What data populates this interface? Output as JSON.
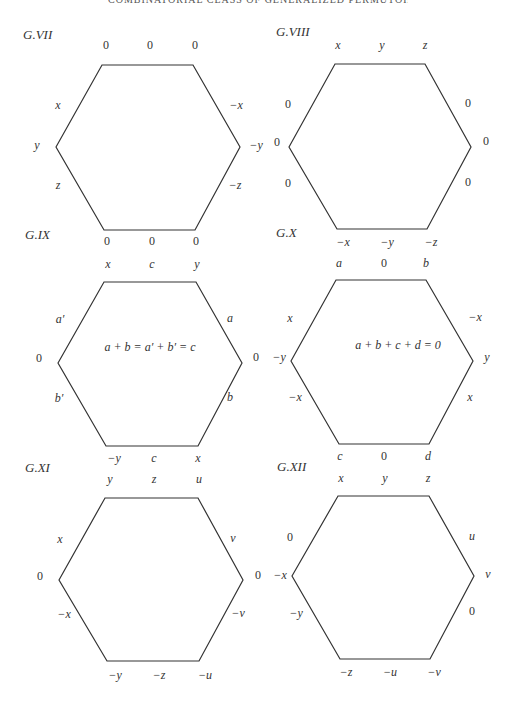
{
  "running_head": "COMBINATORIAL CLASS OF GENERALIZED PERMUTOHEDRA",
  "figures": [
    {
      "title": "G.VII",
      "vertices": [
        [
          56,
          147
        ],
        [
          102,
          65
        ],
        [
          193,
          65
        ],
        [
          240,
          147
        ],
        [
          195,
          230
        ],
        [
          104,
          230
        ]
      ],
      "top_labels": [
        "0",
        "0",
        "0"
      ],
      "left_labels": [
        "x",
        "y",
        "z"
      ],
      "right_labels": [
        "−x",
        "−y",
        "−z"
      ],
      "bottom_labels": [
        "0",
        "0",
        "0"
      ]
    },
    {
      "title": "G.VIII",
      "vertices": [
        [
          289,
          147
        ],
        [
          335,
          64
        ],
        [
          425,
          64
        ],
        [
          471,
          147
        ],
        [
          427,
          229
        ],
        [
          337,
          229
        ]
      ],
      "top_labels": [
        "x",
        "y",
        "z"
      ],
      "left_labels": [
        "0",
        "0",
        "0"
      ],
      "right_labels": [
        "0",
        "0",
        "0"
      ],
      "bottom_labels": [
        "−x",
        "−y",
        "−z"
      ]
    },
    {
      "title": "G.IX",
      "vertices": [
        [
          58,
          363
        ],
        [
          104,
          282
        ],
        [
          196,
          282
        ],
        [
          242,
          363
        ],
        [
          198,
          446
        ],
        [
          106,
          446
        ]
      ],
      "top_labels": [
        "x",
        "c",
        "y"
      ],
      "left_labels": [
        "a′",
        "0",
        "b′"
      ],
      "right_labels": [
        "a",
        "0",
        "b"
      ],
      "bottom_labels": [
        "−y",
        "c",
        "x"
      ],
      "equation": "a + b = a′ + b′ = c"
    },
    {
      "title": "G.X",
      "vertices": [
        [
          291,
          361
        ],
        [
          336,
          280
        ],
        [
          426,
          280
        ],
        [
          473,
          361
        ],
        [
          429,
          444
        ],
        [
          339,
          444
        ]
      ],
      "top_labels": [
        "a",
        "0",
        "b"
      ],
      "left_labels": [
        "x",
        "−y",
        "−x"
      ],
      "right_labels": [
        "−x",
        "y",
        "x"
      ],
      "bottom_labels": [
        "c",
        "0",
        "d"
      ],
      "equation": "a + b + c + d = 0"
    },
    {
      "title": "G.XI",
      "vertices": [
        [
          59,
          580
        ],
        [
          105,
          498
        ],
        [
          198,
          498
        ],
        [
          243,
          580
        ],
        [
          199,
          661
        ],
        [
          107,
          661
        ]
      ],
      "top_labels": [
        "y",
        "z",
        "u"
      ],
      "left_labels": [
        "x",
        "0",
        "−x"
      ],
      "right_labels": [
        "v",
        "0",
        "−v"
      ],
      "bottom_labels": [
        "−y",
        "−z",
        "−u"
      ]
    },
    {
      "title": "G.XII",
      "vertices": [
        [
          292,
          576
        ],
        [
          338,
          496
        ],
        [
          429,
          496
        ],
        [
          474,
          576
        ],
        [
          430,
          659
        ],
        [
          340,
          659
        ]
      ],
      "top_labels": [
        "x",
        "y",
        "z"
      ],
      "left_labels": [
        "0",
        "−x",
        "−y"
      ],
      "right_labels": [
        "u",
        "v",
        "0"
      ],
      "bottom_labels": [
        "−z",
        "−u",
        "−v"
      ]
    }
  ]
}
